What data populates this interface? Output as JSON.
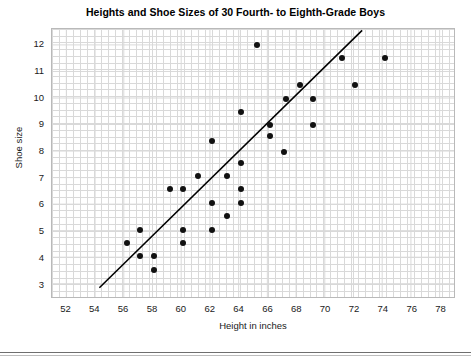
{
  "chart_data": {
    "type": "scatter",
    "title": "Heights and Shoe Sizes of 30 Fourth- to Eighth-Grade Boys",
    "xlabel": "Height in inches",
    "ylabel": "Shoe size",
    "xlim": [
      51,
      79
    ],
    "ylim": [
      2.5,
      12.6
    ],
    "xticks": [
      52,
      54,
      56,
      58,
      60,
      62,
      64,
      66,
      68,
      70,
      72,
      74,
      76,
      78
    ],
    "yticks": [
      3,
      4,
      5,
      6,
      7,
      8,
      9,
      10,
      11,
      12
    ],
    "grid": true,
    "legend": null,
    "n_points": 30,
    "point_color": "#111111",
    "grid_color": "#d9d9d9",
    "trendline": {
      "label": "line of best fit",
      "color": "#000000",
      "x_start": 54.3,
      "y_start": 2.85,
      "x_end": 72.6,
      "y_end": 12.55
    },
    "points": [
      {
        "x": 65.2,
        "y": 12.0
      },
      {
        "x": 71.1,
        "y": 11.5
      },
      {
        "x": 74.1,
        "y": 11.5
      },
      {
        "x": 68.2,
        "y": 10.5
      },
      {
        "x": 72.0,
        "y": 10.5
      },
      {
        "x": 67.2,
        "y": 10.0
      },
      {
        "x": 69.1,
        "y": 10.0
      },
      {
        "x": 64.1,
        "y": 9.5
      },
      {
        "x": 66.1,
        "y": 9.0
      },
      {
        "x": 69.1,
        "y": 9.0
      },
      {
        "x": 66.1,
        "y": 8.6
      },
      {
        "x": 62.1,
        "y": 8.4
      },
      {
        "x": 67.1,
        "y": 8.0
      },
      {
        "x": 64.1,
        "y": 7.6
      },
      {
        "x": 63.1,
        "y": 7.1
      },
      {
        "x": 61.1,
        "y": 7.1
      },
      {
        "x": 59.2,
        "y": 6.6
      },
      {
        "x": 60.1,
        "y": 6.6
      },
      {
        "x": 64.1,
        "y": 6.6
      },
      {
        "x": 62.1,
        "y": 6.1
      },
      {
        "x": 64.1,
        "y": 6.1
      },
      {
        "x": 63.1,
        "y": 5.6
      },
      {
        "x": 57.1,
        "y": 5.1
      },
      {
        "x": 60.1,
        "y": 5.1
      },
      {
        "x": 62.1,
        "y": 5.1
      },
      {
        "x": 56.2,
        "y": 4.6
      },
      {
        "x": 60.1,
        "y": 4.6
      },
      {
        "x": 57.1,
        "y": 4.1
      },
      {
        "x": 58.1,
        "y": 4.1
      },
      {
        "x": 58.1,
        "y": 3.6
      }
    ]
  }
}
